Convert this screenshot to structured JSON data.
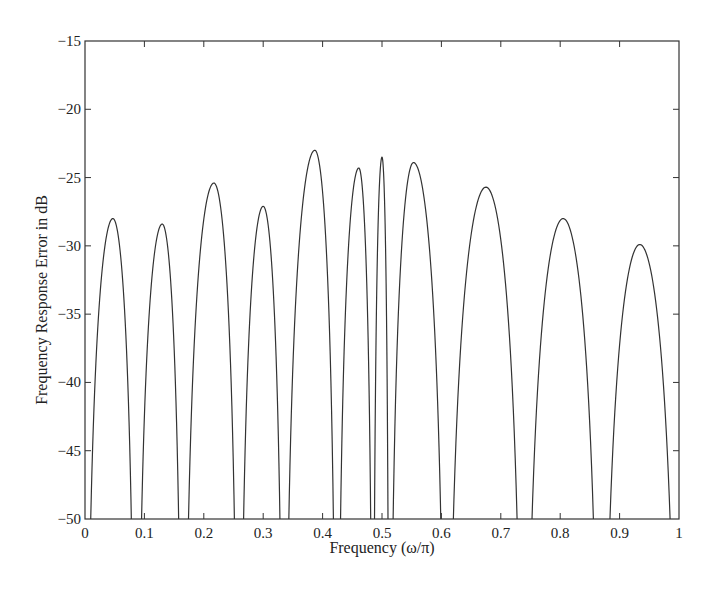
{
  "chart_data": {
    "type": "line",
    "title": "",
    "xlabel": "Frequency (ω/π)",
    "ylabel": "Frequency Response Error in dB",
    "xlim": [
      0,
      1
    ],
    "ylim": [
      -50,
      -15
    ],
    "xticks": [
      0,
      0.1,
      0.2,
      0.3,
      0.4,
      0.5,
      0.6,
      0.7,
      0.8,
      0.9,
      1
    ],
    "xtick_labels": [
      "0",
      "0.1",
      "0.2",
      "0.3",
      "0.4",
      "0.5",
      "0.6",
      "0.7",
      "0.8",
      "0.9",
      "1"
    ],
    "yticks": [
      -15,
      -20,
      -25,
      -30,
      -35,
      -40,
      -45,
      -50
    ],
    "ytick_labels": [
      "−15",
      "−20",
      "−25",
      "−30",
      "−35",
      "−40",
      "−45",
      "−50"
    ],
    "grid": false,
    "legend": null,
    "series": [
      {
        "name": "error",
        "color": "#333333",
        "lobes": [
          {
            "start": 0.0,
            "end": 0.086,
            "peak_x": 0.047,
            "peak_db": -28.0
          },
          {
            "start": 0.086,
            "end": 0.165,
            "peak_x": 0.13,
            "peak_db": -28.4
          },
          {
            "start": 0.165,
            "end": 0.259,
            "peak_x": 0.217,
            "peak_db": -25.4
          },
          {
            "start": 0.259,
            "end": 0.335,
            "peak_x": 0.3,
            "peak_db": -27.1
          },
          {
            "start": 0.335,
            "end": 0.424,
            "peak_x": 0.387,
            "peak_db": -23.0
          },
          {
            "start": 0.424,
            "end": 0.485,
            "peak_x": 0.461,
            "peak_db": -24.3
          },
          {
            "start": 0.485,
            "end": 0.512,
            "peak_x": 0.5,
            "peak_db": -23.5
          },
          {
            "start": 0.512,
            "end": 0.608,
            "peak_x": 0.553,
            "peak_db": -23.9
          },
          {
            "start": 0.608,
            "end": 0.739,
            "peak_x": 0.675,
            "peak_db": -25.7
          },
          {
            "start": 0.739,
            "end": 0.869,
            "peak_x": 0.805,
            "peak_db": -28.0
          },
          {
            "start": 0.869,
            "end": 1.0,
            "peak_x": 0.934,
            "peak_db": -29.9
          }
        ]
      }
    ]
  },
  "layout": {
    "plot_left": 85,
    "plot_right": 679,
    "plot_top": 41,
    "plot_bottom": 519
  }
}
